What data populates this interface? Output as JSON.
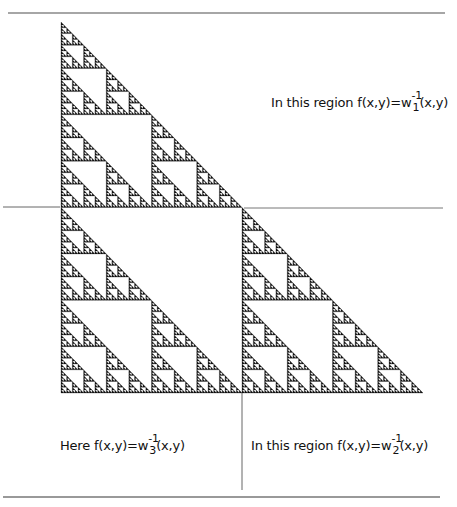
{
  "diagram": {
    "type": "sierpinski-right-triangle",
    "triangle": {
      "top": [
        61,
        22
      ],
      "bottom_left": [
        61,
        393
      ],
      "bottom_right": [
        423,
        393
      ],
      "depth": 7,
      "fill": "#111111"
    },
    "lines": {
      "top_rule": {
        "x1": 8,
        "y1": 13,
        "x2": 445,
        "y2": 13,
        "color": "#888888"
      },
      "bottom_rule": {
        "x1": 3,
        "y1": 497,
        "x2": 440,
        "y2": 497,
        "color": "#777777"
      },
      "horizontal_left": {
        "x1": 3,
        "y1": 207,
        "x2": 60,
        "y2": 207,
        "color": "#666666"
      },
      "horizontal_right": {
        "x1": 244,
        "y1": 208,
        "x2": 443,
        "y2": 208,
        "color": "#777777"
      },
      "vertical_divider": {
        "x1": 242,
        "y1": 393,
        "x2": 242,
        "y2": 490,
        "color": "#666666"
      }
    }
  },
  "labels": {
    "region1": {
      "prefix": "In this region  f(x,y)=w",
      "sup": "-1",
      "sub": "1",
      "suffix": "(x,y)"
    },
    "region2": {
      "prefix": "In this region  f(x,y)=w",
      "sup": "-1",
      "sub": "2",
      "suffix": "(x,y)"
    },
    "region3": {
      "prefix": "Here  f(x,y)=w",
      "sup": "-1",
      "sub": "3",
      "suffix": "(x,y)"
    }
  }
}
